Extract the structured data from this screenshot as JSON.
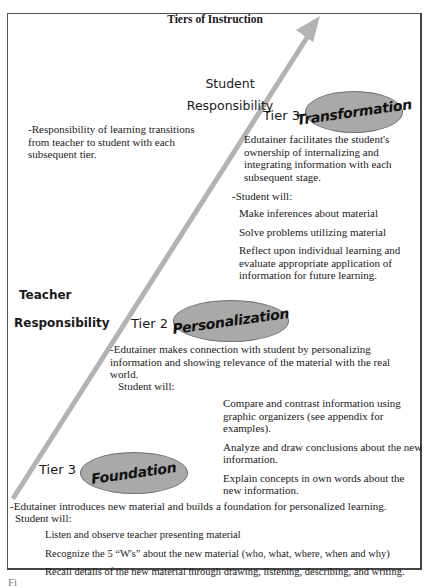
{
  "title": "Tiers of Instruction",
  "axis_labels": {
    "student": [
      "Student",
      "Responsibility"
    ],
    "teacher_line1": "Teacher",
    "teacher_line2": "Responsibility"
  },
  "note": "-Responsibility of learning transitions from teacher to student with each subsequent tier.",
  "colors": {
    "arrow": "#b3b3b3",
    "ellipse_fill": "#a9a9a9",
    "ellipse_border": "#6e6e6e",
    "frame": "#555555"
  },
  "tiers": [
    {
      "label": "Tier 3",
      "name": "Transformation",
      "description": "Edutainer facilitates the student's ownership of internalizing and integrating information with each subsequent stage.",
      "student_will": "-Student will:",
      "items": [
        "Make inferences about material",
        "Solve problems utilizing material",
        "Reflect upon individual learning and evaluate appropriate application of information for future learning."
      ]
    },
    {
      "label": "Tier 2",
      "name": "Personalization",
      "description": "-Edutainer makes connection with student by personalizing information and showing relevance of the material with the real world.",
      "student_will": "Student will:",
      "items": [
        "Compare and contrast information using graphic organizers (see appendix for examples).",
        "Analyze and draw conclusions about the new information.",
        "Explain concepts in own words about the new information."
      ]
    },
    {
      "label": "Tier 1",
      "name": "Foundation",
      "description": "-Edutainer introduces new material and builds a foundation for personalized learning.",
      "student_will": "Student will:",
      "items": [
        "Listen and observe teacher presenting material",
        "Recognize the 5 “W's” about the new material (who, what, where, when and why)",
        "Recall details of the new material through drawing, listening, describing, and writing."
      ]
    }
  ],
  "caption_fragment": "Fi"
}
